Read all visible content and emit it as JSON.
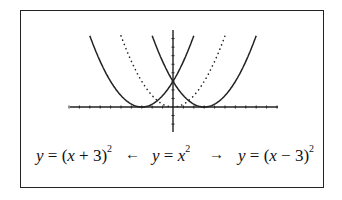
{
  "chart_data": {
    "type": "line",
    "title": "",
    "xlabel": "",
    "ylabel": "",
    "xlim": [
      -10,
      10
    ],
    "ylim": [
      -8,
      27
    ],
    "grid": false,
    "x_ticks_spacing": 1,
    "y_ticks_spacing": 3,
    "series": [
      {
        "name": "y = (x + 3)^2",
        "expression": "(x+3)^2",
        "style": "solid",
        "vertex": [
          -3,
          0
        ]
      },
      {
        "name": "y = x^2",
        "expression": "x^2",
        "style": "dotted",
        "vertex": [
          0,
          0
        ]
      },
      {
        "name": "y = (x - 3)^2",
        "expression": "(x-3)^2",
        "style": "solid",
        "vertex": [
          3,
          0
        ]
      }
    ],
    "annotations": [
      "y = (x + 3)^2  ←  y = x^2  →  y = (x − 3)^2"
    ]
  },
  "labels": {
    "left_eq": {
      "y": "y",
      "eq": " = (",
      "x": "x",
      "rest": " + 3)",
      "exp": "2"
    },
    "left_arrow": "←",
    "center_eq": {
      "y": "y",
      "eq": " = ",
      "x": "x",
      "exp": "2"
    },
    "right_arrow": "→",
    "right_eq": {
      "y": "y",
      "eq": " = (",
      "x": "x",
      "rest": " − 3)",
      "exp": "2"
    }
  },
  "colors": {
    "curve": "#222222",
    "axis": "#222222",
    "border": "#222222"
  }
}
